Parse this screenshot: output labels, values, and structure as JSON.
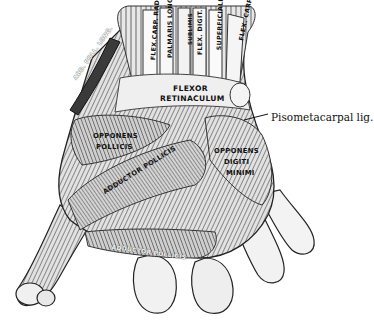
{
  "figure": {
    "colors": {
      "background": "#ffffff",
      "ink": "#111111",
      "shade": "#6b6b6b",
      "light": "#d9d9d9"
    }
  },
  "tendon_labels": [
    {
      "text": "FLEX.CARP. RAD.",
      "x": 150,
      "y": 60,
      "rot": -86,
      "size": 6.2
    },
    {
      "text": "PALMARIS LONG.",
      "x": 167,
      "y": 58,
      "rot": -90,
      "size": 6.2
    },
    {
      "text": "FLEX. DIGIT.",
      "x": 197,
      "y": 55,
      "rot": -90,
      "size": 6.2
    },
    {
      "text": "SUBLIMIS",
      "x": 188,
      "y": 45,
      "rot": -90,
      "size": 5.5
    },
    {
      "text": "SUPERFICIALIS",
      "x": 216,
      "y": 50,
      "rot": -88,
      "size": 6.2
    },
    {
      "text": "FLEX. CARP. ULN.",
      "x": 238,
      "y": 40,
      "rot": -78,
      "size": 6.2
    }
  ],
  "region_labels": [
    {
      "text": "ABD. POLL. LONG.",
      "x": 73,
      "y": 78,
      "rot": -55,
      "size": 5.8,
      "inv": true
    },
    {
      "text": "FLEXOR",
      "x": 173,
      "y": 85,
      "rot": 0,
      "size": 7.6
    },
    {
      "text": "RETINACULUM",
      "x": 160,
      "y": 95,
      "rot": 0,
      "size": 7.6
    },
    {
      "text": "OPPONENS",
      "x": 93,
      "y": 133,
      "rot": 0,
      "size": 6.8
    },
    {
      "text": "POLLICIS",
      "x": 96,
      "y": 144,
      "rot": 0,
      "size": 6.8
    },
    {
      "text": "OPPONENS",
      "x": 214,
      "y": 148,
      "rot": 0,
      "size": 6.8
    },
    {
      "text": "DIGITI",
      "x": 224,
      "y": 159,
      "rot": 0,
      "size": 6.8
    },
    {
      "text": "MINIMI",
      "x": 226,
      "y": 170,
      "rot": 0,
      "size": 6.8
    },
    {
      "text": "ADDUCTOR POLLICIS",
      "x": 102,
      "y": 190,
      "rot": -32,
      "size": 6.8
    },
    {
      "text": "ADDUCTOR POLLICIS",
      "x": 112,
      "y": 244,
      "rot": 8,
      "size": 6.0,
      "inv": true
    }
  ],
  "callouts": [
    {
      "text": "Pisometacarpal lig.",
      "x": 271,
      "y": 112
    }
  ]
}
